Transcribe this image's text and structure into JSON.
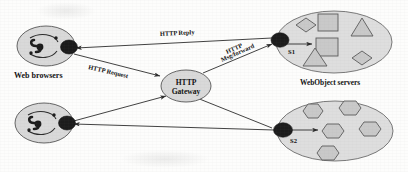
{
  "diagram": {
    "colors": {
      "node_fill": "#d9d9d9",
      "node_stroke": "#555555",
      "group_fill": "#dedede",
      "group_stroke": "#6b6b6b",
      "shape_fill": "#c9c9c9",
      "shape_stroke": "#5a5a5a",
      "port_fill": "#1c1c1c",
      "edge_stroke": "#2b2b2b",
      "text": "#111111",
      "background": "#fdfdfc"
    },
    "clients": {
      "group_label": "Web browsers",
      "nodes": [
        {
          "id": "browser-1",
          "icon": "web-browser-icon"
        },
        {
          "id": "browser-2",
          "icon": "web-browser-icon"
        }
      ]
    },
    "gateway": {
      "id": "http-gateway",
      "label_line1": "HTTP",
      "label_line2": "Gateway"
    },
    "servers": {
      "group_label": "WebObject servers",
      "nodes": [
        {
          "id": "server-s1",
          "label": "S1",
          "objects": [
            "square",
            "square",
            "diamond",
            "diamond",
            "triangle",
            "triangle"
          ]
        },
        {
          "id": "server-s2",
          "label": "S2",
          "objects": [
            "hexagon",
            "hexagon",
            "hexagon",
            "hexagon",
            "hexagon",
            "hexagon"
          ]
        }
      ]
    },
    "edges": [
      {
        "id": "edge-http-reply",
        "label": "HTTP Reply",
        "from": "server-s1",
        "to": "browser-1"
      },
      {
        "id": "edge-http-request",
        "label": "HTTP Request",
        "from": "browser-1",
        "to": "http-gateway"
      },
      {
        "id": "edge-http-forward",
        "label_line1": "HTTP",
        "label_line2": "Msg/forward",
        "from": "http-gateway",
        "to": "server-s1"
      },
      {
        "id": "edge-browser2-out",
        "label": "",
        "from": "browser-2",
        "to": "http-gateway"
      },
      {
        "id": "edge-s2-to-browser2",
        "label": "",
        "from": "server-s2",
        "to": "browser-2"
      },
      {
        "id": "edge-gateway-to-s2",
        "label": "",
        "from": "http-gateway",
        "to": "server-s2"
      }
    ]
  }
}
